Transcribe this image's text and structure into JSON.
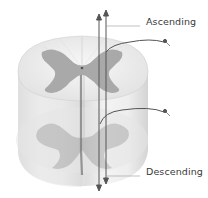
{
  "diagram": {
    "labels": {
      "ascending": "Ascending",
      "descending": "Descending"
    },
    "colors": {
      "white_matter": "#eeeeee",
      "grey_matter": "#a9a9a9",
      "tract_line": "#555555",
      "label_text": "#3a3a3a"
    }
  }
}
